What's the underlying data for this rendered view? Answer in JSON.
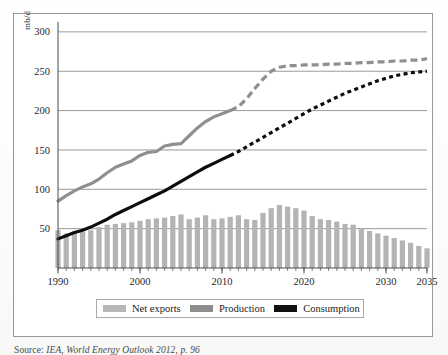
{
  "figure": {
    "caption_prefix": "Source:",
    "caption_rest": "IEA, World Energy Outlook 2012, p. 96"
  },
  "axis": {
    "ylabel": "mb/d",
    "yticks": [
      50,
      100,
      150,
      200,
      250,
      300
    ],
    "xticks": [
      1990,
      2000,
      2010,
      2020,
      2030,
      2035
    ]
  },
  "legend": {
    "items": [
      {
        "label": "Net exports",
        "color": "#b6b6b6"
      },
      {
        "label": "Production",
        "color": "#8d8d8d"
      },
      {
        "label": "Consumption",
        "color": "#111111"
      }
    ]
  },
  "colors": {
    "bars": "#b4b4b4",
    "production": "#8f8f8f",
    "consumption": "#0d0d0d",
    "grid": "#8f8f8f",
    "axis": "#4a4a4a",
    "frame": "#9a9a9a"
  },
  "chart_data": {
    "type": "line",
    "title": "",
    "xlabel": "",
    "ylabel": "mb/d",
    "xlim": [
      1990,
      2035
    ],
    "ylim": [
      0,
      310
    ],
    "yticks": [
      50,
      100,
      150,
      200,
      250,
      300
    ],
    "xticks": [
      1990,
      2000,
      2010,
      2020,
      2030,
      2035
    ],
    "grid": "horizontal",
    "legend_position": "bottom",
    "projection_starts": 2011,
    "x": [
      1990,
      1991,
      1992,
      1993,
      1994,
      1995,
      1996,
      1997,
      1998,
      1999,
      2000,
      2001,
      2002,
      2003,
      2004,
      2005,
      2006,
      2007,
      2008,
      2009,
      2010,
      2011,
      2012,
      2013,
      2014,
      2015,
      2016,
      2017,
      2018,
      2019,
      2020,
      2021,
      2022,
      2023,
      2024,
      2025,
      2026,
      2027,
      2028,
      2029,
      2030,
      2031,
      2032,
      2033,
      2034,
      2035
    ],
    "series": [
      {
        "name": "Net exports",
        "type": "bar",
        "color": "#b4b4b4",
        "values": [
          48,
          44,
          46,
          46,
          48,
          52,
          55,
          56,
          57,
          58,
          60,
          62,
          63,
          64,
          66,
          68,
          62,
          64,
          67,
          62,
          63,
          65,
          67,
          62,
          61,
          70,
          76,
          80,
          78,
          76,
          73,
          66,
          62,
          61,
          59,
          56,
          55,
          50,
          47,
          44,
          41,
          38,
          35,
          32,
          28,
          25
        ]
      },
      {
        "name": "Production",
        "type": "line",
        "color": "#8f8f8f",
        "values": [
          85,
          92,
          98,
          103,
          107,
          113,
          121,
          128,
          132,
          136,
          143,
          147,
          148,
          155,
          157,
          158,
          168,
          178,
          186,
          192,
          196,
          200,
          205,
          215,
          228,
          240,
          250,
          255,
          257,
          257,
          258,
          258,
          258,
          259,
          259,
          260,
          260,
          261,
          261,
          262,
          262,
          263,
          263,
          264,
          264,
          266
        ]
      },
      {
        "name": "Consumption",
        "type": "line",
        "color": "#0d0d0d",
        "values": [
          37,
          41,
          45,
          48,
          52,
          57,
          62,
          68,
          73,
          78,
          83,
          88,
          93,
          98,
          104,
          110,
          116,
          122,
          128,
          133,
          138,
          143,
          148,
          154,
          160,
          166,
          172,
          178,
          184,
          190,
          196,
          202,
          207,
          212,
          217,
          222,
          226,
          230,
          234,
          238,
          241,
          244,
          246,
          248,
          249,
          250
        ]
      }
    ]
  }
}
